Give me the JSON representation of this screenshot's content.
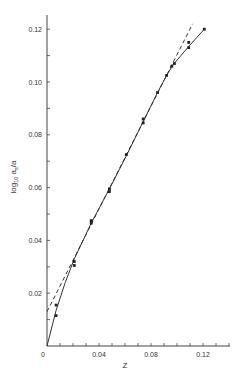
{
  "chart_data": {
    "type": "scatter",
    "title": "",
    "xlabel": "Z",
    "ylabel": "log10 as/a",
    "ylabel_parts": {
      "prefix": "log",
      "sub1": "10",
      "mid": " a",
      "sub2": "s",
      "suffix": "/a"
    },
    "xlim": [
      0,
      0.14
    ],
    "ylim": [
      0,
      0.125
    ],
    "x_ticks_major": [
      0,
      0.04,
      0.08,
      0.12
    ],
    "x_tick_labels": [
      "0",
      "0.04",
      "0.08",
      "0.12"
    ],
    "x_tick_minor_step": 0.01,
    "y_ticks_major": [
      0,
      0.02,
      0.04,
      0.06,
      0.08,
      0.1,
      0.12
    ],
    "y_tick_labels": [
      "0",
      "0.02",
      "0.04",
      "0.06",
      "0.08",
      "0.10",
      "0.12"
    ],
    "y_tick_minor_step": 0.01,
    "grid": false,
    "series": [
      {
        "name": "measured",
        "style": "points",
        "x": [
          0.007,
          0.007,
          0.021,
          0.021,
          0.034,
          0.034,
          0.048,
          0.048,
          0.061,
          0.074,
          0.074,
          0.085,
          0.092,
          0.096,
          0.098,
          0.109,
          0.109,
          0.121
        ],
        "y": [
          0.0115,
          0.0155,
          0.0305,
          0.032,
          0.0465,
          0.0475,
          0.0585,
          0.0595,
          0.0725,
          0.0845,
          0.086,
          0.096,
          0.1025,
          0.106,
          0.107,
          0.113,
          0.115,
          0.12
        ]
      },
      {
        "name": "fitted curve",
        "style": "solid",
        "x": [
          0,
          0.007,
          0.014,
          0.021,
          0.034,
          0.048,
          0.061,
          0.074,
          0.085,
          0.092,
          0.097,
          0.103,
          0.11,
          0.121
        ],
        "y": [
          0,
          0.0135,
          0.024,
          0.033,
          0.0465,
          0.0595,
          0.072,
          0.085,
          0.096,
          0.1025,
          0.1065,
          0.11,
          0.114,
          0.12
        ]
      },
      {
        "name": "linear extrapolation",
        "style": "dashed",
        "x": [
          0,
          0.112
        ],
        "y": [
          0.013,
          0.122
        ]
      }
    ]
  }
}
